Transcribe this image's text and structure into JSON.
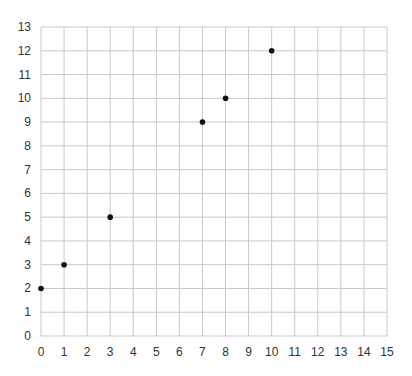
{
  "chart_data": {
    "type": "scatter",
    "title": "",
    "xlabel": "",
    "ylabel": "",
    "xlim": [
      0,
      15
    ],
    "ylim": [
      0,
      13
    ],
    "grid": true,
    "legend": null,
    "x_ticks": [
      0,
      1,
      2,
      3,
      4,
      5,
      6,
      7,
      8,
      9,
      10,
      11,
      12,
      13,
      14,
      15
    ],
    "y_ticks": [
      0,
      1,
      2,
      3,
      4,
      5,
      6,
      7,
      8,
      9,
      10,
      11,
      12,
      13
    ],
    "series": [
      {
        "name": "points",
        "color": "#111111",
        "points": [
          {
            "x": 0,
            "y": 2
          },
          {
            "x": 1,
            "y": 3
          },
          {
            "x": 3,
            "y": 5
          },
          {
            "x": 7,
            "y": 9
          },
          {
            "x": 8,
            "y": 10
          },
          {
            "x": 10,
            "y": 12
          }
        ]
      }
    ]
  },
  "style": {
    "grid_color": "#c8c8c8",
    "text_color": "#333333",
    "point_color": "#111111"
  }
}
